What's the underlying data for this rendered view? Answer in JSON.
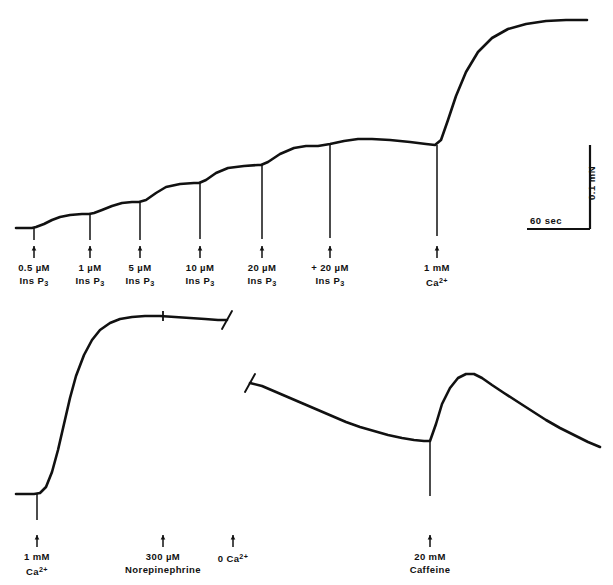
{
  "figure": {
    "type": "physiological-force-recording",
    "background": "#ffffff",
    "trace_color": "#111111",
    "width": 613,
    "height": 585
  },
  "scale_bar": {
    "vertical_label": "0.1 mN",
    "horizontal_label": "60 sec",
    "vertical_value": 0.1,
    "vertical_unit": "mN",
    "horizontal_value": 60,
    "horizontal_unit": "sec"
  },
  "top_trace": {
    "name": "InsP3 cumulative dose-response with Ca2+ maximum",
    "markers": [
      {
        "id": "m1",
        "x": 34,
        "line1": "0.5 µM",
        "line2_pre": "Ins P",
        "line2_sub": "3",
        "dose": "0.5 µM",
        "agent": "InsP3"
      },
      {
        "id": "m2",
        "x": 90,
        "line1": "1 µM",
        "line2_pre": "Ins P",
        "line2_sub": "3",
        "dose": "1 µM",
        "agent": "InsP3"
      },
      {
        "id": "m3",
        "x": 140,
        "line1": "5 µM",
        "line2_pre": "Ins P",
        "line2_sub": "3",
        "dose": "5 µM",
        "agent": "InsP3"
      },
      {
        "id": "m4",
        "x": 200,
        "line1": "10 µM",
        "line2_pre": "Ins P",
        "line2_sub": "3",
        "dose": "10 µM",
        "agent": "InsP3"
      },
      {
        "id": "m5",
        "x": 262,
        "line1": "20 µM",
        "line2_pre": "Ins P",
        "line2_sub": "3",
        "dose": "20 µM",
        "agent": "InsP3"
      },
      {
        "id": "m6",
        "x": 330,
        "line1": "+ 20 µM",
        "line2_pre": "Ins P",
        "line2_sub": "3",
        "dose": "+20 µM",
        "agent": "InsP3"
      },
      {
        "id": "m7",
        "x": 437,
        "line1": "1 mM",
        "line2_pre": "Ca",
        "line2_sup": "2+",
        "dose": "1 mM",
        "agent": "Ca2+"
      }
    ]
  },
  "bottom_left_trace": {
    "name": "1 mM Ca2+ contracture then norepinephrine",
    "markers": [
      {
        "id": "b1",
        "x": 37,
        "line1": "1 mM",
        "line2_pre": "Ca",
        "line2_sup": "2+",
        "dose": "1 mM",
        "agent": "Ca2+"
      },
      {
        "id": "b2",
        "x": 163,
        "line1": "300 µM",
        "line2_pre": "Norepinephrine",
        "dose": "300 µM",
        "agent": "Norepinephrine"
      }
    ]
  },
  "bottom_right_trace": {
    "name": "Zero Ca2+ relaxation then caffeine response",
    "markers": [
      {
        "id": "b3",
        "x": 233,
        "line1_pre": "0 Ca",
        "line1_sup": "2+",
        "dose": "0",
        "agent": "Ca2+"
      },
      {
        "id": "b4",
        "x": 430,
        "line1": "20 mM",
        "line2_pre": "Caffeine",
        "dose": "20 mM",
        "agent": "Caffeine"
      }
    ]
  },
  "chart_data": {
    "type": "line",
    "title": "",
    "xlabel": "time",
    "ylabel": "force (mN)",
    "series": [
      {
        "name": "upper-trace",
        "points": [
          [
            16,
            228
          ],
          [
            24,
            228
          ],
          [
            32,
            228
          ],
          [
            36,
            227
          ],
          [
            44,
            224
          ],
          [
            52,
            220
          ],
          [
            60,
            217
          ],
          [
            70,
            215
          ],
          [
            82,
            214
          ],
          [
            89,
            214
          ],
          [
            94,
            213
          ],
          [
            102,
            210
          ],
          [
            112,
            206
          ],
          [
            122,
            203
          ],
          [
            132,
            202
          ],
          [
            139,
            202
          ],
          [
            146,
            200
          ],
          [
            156,
            193
          ],
          [
            166,
            187
          ],
          [
            180,
            184
          ],
          [
            194,
            183
          ],
          [
            199,
            183
          ],
          [
            206,
            180
          ],
          [
            216,
            173
          ],
          [
            228,
            168
          ],
          [
            244,
            166
          ],
          [
            258,
            165
          ],
          [
            261,
            165
          ],
          [
            268,
            162
          ],
          [
            280,
            154
          ],
          [
            294,
            148
          ],
          [
            306,
            146
          ],
          [
            318,
            146
          ],
          [
            330,
            144
          ],
          [
            344,
            141
          ],
          [
            358,
            139
          ],
          [
            372,
            139
          ],
          [
            390,
            140
          ],
          [
            410,
            142
          ],
          [
            426,
            144
          ],
          [
            435,
            145
          ],
          [
            441,
            140
          ],
          [
            448,
            120
          ],
          [
            456,
            96
          ],
          [
            466,
            72
          ],
          [
            478,
            52
          ],
          [
            492,
            38
          ],
          [
            508,
            29
          ],
          [
            526,
            24
          ],
          [
            546,
            21
          ],
          [
            566,
            20
          ],
          [
            587,
            20
          ]
        ]
      },
      {
        "name": "lower-left-trace",
        "points": [
          [
            16,
            494
          ],
          [
            26,
            494
          ],
          [
            34,
            494
          ],
          [
            40,
            493
          ],
          [
            46,
            487
          ],
          [
            52,
            472
          ],
          [
            58,
            450
          ],
          [
            64,
            424
          ],
          [
            70,
            398
          ],
          [
            76,
            376
          ],
          [
            84,
            355
          ],
          [
            92,
            340
          ],
          [
            100,
            330
          ],
          [
            110,
            323
          ],
          [
            120,
            319
          ],
          [
            132,
            317
          ],
          [
            145,
            316
          ],
          [
            160,
            316
          ],
          [
            175,
            317
          ],
          [
            190,
            318
          ],
          [
            205,
            319
          ],
          [
            218,
            320
          ],
          [
            227,
            320
          ]
        ]
      },
      {
        "name": "lower-right-trace",
        "points": [
          [
            250,
            383
          ],
          [
            262,
            386
          ],
          [
            276,
            392
          ],
          [
            290,
            398
          ],
          [
            304,
            404
          ],
          [
            318,
            410
          ],
          [
            332,
            416
          ],
          [
            346,
            422
          ],
          [
            360,
            427
          ],
          [
            374,
            431
          ],
          [
            388,
            435
          ],
          [
            402,
            438
          ],
          [
            414,
            440
          ],
          [
            424,
            441
          ],
          [
            430,
            441
          ],
          [
            436,
            424
          ],
          [
            442,
            404
          ],
          [
            450,
            388
          ],
          [
            458,
            378
          ],
          [
            466,
            374
          ],
          [
            474,
            374
          ],
          [
            482,
            378
          ],
          [
            492,
            385
          ],
          [
            504,
            393
          ],
          [
            518,
            402
          ],
          [
            532,
            411
          ],
          [
            546,
            420
          ],
          [
            560,
            428
          ],
          [
            574,
            435
          ],
          [
            588,
            442
          ],
          [
            600,
            447
          ]
        ]
      }
    ],
    "spikes_down": [
      {
        "trace": "upper",
        "x": 34,
        "top": 228,
        "bottom": 240
      },
      {
        "trace": "upper",
        "x": 90,
        "top": 214,
        "bottom": 240
      },
      {
        "trace": "upper",
        "x": 140,
        "top": 202,
        "bottom": 240
      },
      {
        "trace": "upper",
        "x": 200,
        "top": 183,
        "bottom": 239
      },
      {
        "trace": "upper",
        "x": 262,
        "top": 165,
        "bottom": 239
      },
      {
        "trace": "upper",
        "x": 330,
        "top": 144,
        "bottom": 238
      },
      {
        "trace": "upper",
        "x": 437,
        "top": 145,
        "bottom": 236
      },
      {
        "trace": "lower-left",
        "x": 37,
        "top": 494,
        "bottom": 520
      },
      {
        "trace": "lower-right",
        "x": 430,
        "top": 441,
        "bottom": 496
      }
    ],
    "break_marks": [
      {
        "trace": "lower-left",
        "x": 227,
        "y": 320
      },
      {
        "trace": "lower-right",
        "x": 250,
        "y": 383
      }
    ],
    "tick_marks": [
      {
        "trace": "lower-left",
        "x": 163,
        "y": 316
      }
    ]
  }
}
